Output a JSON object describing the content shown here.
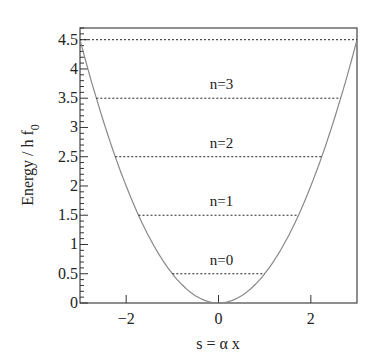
{
  "chart_data": {
    "type": "line",
    "title": "",
    "xlabel": "s =  α x",
    "ylabel": "Energy / h f",
    "ylabel_subscript": "0",
    "xlim": [
      -3,
      3
    ],
    "ylim": [
      0,
      4.7
    ],
    "xticks": [
      -2,
      0,
      2
    ],
    "xtick_labels": [
      "−2",
      "0",
      "2"
    ],
    "yticks": [
      0,
      0.5,
      1,
      1.5,
      2,
      2.5,
      3,
      3.5,
      4,
      4.5
    ],
    "ytick_labels": [
      "0",
      "0.5",
      "1",
      "1.5",
      "2",
      "2.5",
      "3",
      "3.5",
      "4",
      "4.5"
    ],
    "grid": false,
    "series": [
      {
        "name": "potential",
        "formula": "E = s^2 / 2",
        "x": [
          -3,
          -2,
          -1,
          0,
          1,
          2,
          3
        ],
        "values": [
          4.5,
          2,
          0.5,
          0,
          0.5,
          2,
          4.5
        ],
        "color": "#888888",
        "style": "solid"
      }
    ],
    "levels": [
      {
        "label": "n=0",
        "energy": 0.5,
        "s_range": [
          -1,
          1
        ]
      },
      {
        "label": "n=1",
        "energy": 1.5,
        "s_range": [
          -1.732,
          1.732
        ]
      },
      {
        "label": "n=2",
        "energy": 2.5,
        "s_range": [
          -2.236,
          2.236
        ]
      },
      {
        "label": "n=3",
        "energy": 3.5,
        "s_range": [
          -2.646,
          2.646
        ]
      },
      {
        "label": "",
        "energy": 4.5,
        "s_range": [
          -3,
          3
        ]
      }
    ]
  }
}
